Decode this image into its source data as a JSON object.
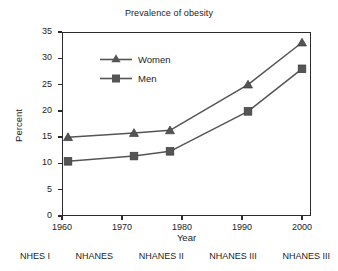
{
  "chart_data": {
    "type": "line",
    "title": "Prevalence of obesity",
    "xlabel": "Year",
    "ylabel": "Percent",
    "x": [
      1961,
      1972,
      1978,
      1991,
      2000
    ],
    "series": [
      {
        "name": "Women",
        "marker": "triangle",
        "color": "#555555",
        "values": [
          15.0,
          15.8,
          16.3,
          25.0,
          33.0
        ]
      },
      {
        "name": "Men",
        "marker": "square",
        "color": "#555555",
        "values": [
          10.4,
          11.4,
          12.3,
          19.9,
          28.0
        ]
      }
    ],
    "xlim": [
      1960,
      2001.5
    ],
    "ylim": [
      0,
      35
    ],
    "xticks": [
      1960,
      1970,
      1980,
      1990,
      2000
    ],
    "xtick_labels": [
      "1960",
      "1970",
      "1980",
      "1990",
      "2000"
    ],
    "yticks": [
      0,
      5,
      10,
      15,
      20,
      25,
      30,
      35
    ],
    "ytick_labels": [
      "0",
      "5",
      "10",
      "15",
      "20",
      "25",
      "30",
      "35"
    ],
    "grid": false,
    "legend_position": "upper-left-inside",
    "annotations": {
      "surveys": [
        "NHES I",
        "NHANES",
        "NHANES II",
        "NHANES III",
        "NHANES III"
      ]
    },
    "line_color": "#555555",
    "axis_color": "#2b2b2b"
  },
  "legend": {
    "entries": [
      {
        "label": "Women"
      },
      {
        "label": "Men"
      }
    ]
  },
  "footer": {
    "surveys": [
      "NHES I",
      "NHANES",
      "NHANES II",
      "NHANES III",
      "NHANES III"
    ]
  }
}
